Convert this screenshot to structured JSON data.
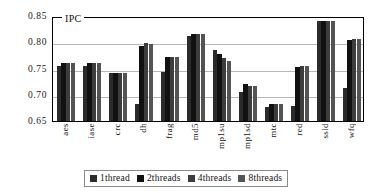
{
  "chart_data": {
    "type": "bar",
    "title": "IPC",
    "xlabel": "",
    "ylabel": "IPC",
    "ylim": [
      0.65,
      0.85
    ],
    "yticks": [
      "0.85",
      "0.80",
      "0.75",
      "0.70",
      "0.65"
    ],
    "ytick_values": [
      0.85,
      0.8,
      0.75,
      0.7,
      0.65
    ],
    "grid": true,
    "legend_position": "bottom",
    "categories": [
      "aes",
      "iase",
      "crc",
      "dh",
      "frag",
      "md5",
      "mp1su",
      "mp1sd",
      "mtc",
      "red",
      "ssld",
      "wfq"
    ],
    "series": [
      {
        "name": "1thread",
        "color": "#2b2b2b",
        "values": [
          0.754,
          0.754,
          0.741,
          0.682,
          0.744,
          0.812,
          0.785,
          0.706,
          0.677,
          0.679,
          0.84,
          0.712
        ]
      },
      {
        "name": "2threads",
        "color": "#111111",
        "values": [
          0.76,
          0.76,
          0.741,
          0.793,
          0.771,
          0.816,
          0.778,
          0.72,
          0.682,
          0.753,
          0.841,
          0.805
        ]
      },
      {
        "name": "4threads",
        "color": "#3d3d3d",
        "values": [
          0.76,
          0.76,
          0.741,
          0.798,
          0.771,
          0.816,
          0.77,
          0.716,
          0.682,
          0.755,
          0.841,
          0.806
        ]
      },
      {
        "name": "8threads",
        "color": "#545454",
        "values": [
          0.76,
          0.76,
          0.741,
          0.797,
          0.771,
          0.816,
          0.765,
          0.716,
          0.682,
          0.755,
          0.841,
          0.806
        ]
      }
    ]
  }
}
